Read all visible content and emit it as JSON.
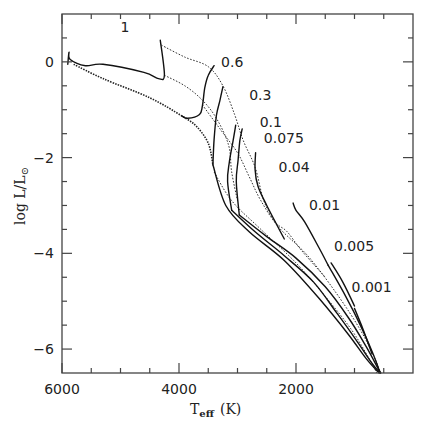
{
  "chart_data": {
    "type": "line",
    "title": "",
    "xlabel": "T_eff (K)",
    "xlabel_main": "T",
    "xlabel_sub": "eff",
    "xlabel_unit": "(K)",
    "ylabel": "log L/L⊙",
    "ylabel_main": "log L/L",
    "ylabel_sub": "⊙",
    "xlim": [
      6000,
      0
    ],
    "ylim": [
      -6.5,
      1.0
    ],
    "x_inverted": true,
    "grid": false,
    "x_major_ticks": [
      6000,
      4000,
      2000
    ],
    "x_minor_ticks": [
      5500,
      5000,
      4500,
      3500,
      3000,
      2500,
      1500,
      1000,
      500
    ],
    "x_tick_labels": [
      "6000",
      "4000",
      "2000"
    ],
    "y_major_ticks": [
      0,
      -2,
      -4,
      -6
    ],
    "y_minor_ticks": [
      0.5,
      -0.5,
      -1,
      -1.5,
      -2.5,
      -3,
      -3.5,
      -4.5,
      -5,
      -5.5
    ],
    "y_tick_labels": [
      "0",
      "−2",
      "−4",
      "−6"
    ],
    "series_note": "Solid lines: evolutionary tracks labelled by mass (M⊙). Dotted lines: isochrones.",
    "tracks": [
      {
        "name": "1",
        "label_pos": [
          5000,
          0.62
        ],
        "points": [
          [
            5900,
            -0.05
          ],
          [
            5880,
            0.2
          ],
          [
            5860,
            0.05
          ],
          [
            5600,
            -0.08
          ],
          [
            5300,
            -0.05
          ],
          [
            4600,
            -0.22
          ],
          [
            4350,
            -0.35
          ],
          [
            4250,
            -0.28
          ],
          [
            4320,
            0.45
          ]
        ]
      },
      {
        "name": "0.6",
        "label_pos": [
          3280,
          -0.1
        ],
        "points": [
          [
            3950,
            -1.13
          ],
          [
            3850,
            -1.18
          ],
          [
            3650,
            -1.1
          ],
          [
            3600,
            -0.92
          ],
          [
            3560,
            -0.55
          ],
          [
            3500,
            -0.28
          ],
          [
            3400,
            -0.08
          ]
        ]
      },
      {
        "name": "0.3",
        "label_pos": [
          2800,
          -0.8
        ],
        "points": [
          [
            3420,
            -2.15
          ],
          [
            3400,
            -1.62
          ],
          [
            3360,
            -1.12
          ],
          [
            3300,
            -0.8
          ],
          [
            3250,
            -0.52
          ]
        ]
      },
      {
        "name": "0.1",
        "label_pos": [
          2620,
          -1.35
        ],
        "points": [
          [
            3100,
            -3.1
          ],
          [
            3170,
            -2.5
          ],
          [
            3140,
            -2.1
          ],
          [
            3080,
            -1.68
          ],
          [
            3030,
            -1.32
          ]
        ]
      },
      {
        "name": "0.075",
        "label_pos": [
          2550,
          -1.7
        ],
        "points": [
          [
            2970,
            -3.2
          ],
          [
            3020,
            -2.5
          ],
          [
            2990,
            -2.05
          ],
          [
            2960,
            -1.65
          ],
          [
            2920,
            -1.4
          ]
        ]
      },
      {
        "name": "0.04",
        "label_pos": [
          2300,
          -2.3
        ],
        "points": [
          [
            2200,
            -3.7
          ],
          [
            2500,
            -3.0
          ],
          [
            2650,
            -2.6
          ],
          [
            2700,
            -2.25
          ],
          [
            2690,
            -1.9
          ]
        ]
      },
      {
        "name": "0.01",
        "label_pos": [
          1780,
          -3.1
        ],
        "points": [
          [
            1450,
            -4.25
          ],
          [
            1600,
            -3.9
          ],
          [
            1850,
            -3.35
          ],
          [
            2000,
            -3.1
          ],
          [
            2050,
            -2.95
          ]
        ]
      },
      {
        "name": "0.005",
        "label_pos": [
          1350,
          -3.95
        ],
        "points": [
          [
            1000,
            -5.1
          ],
          [
            1200,
            -4.6
          ],
          [
            1400,
            -4.2
          ]
        ]
      },
      {
        "name": "0.001",
        "label_pos": [
          1050,
          -4.8
        ],
        "points": [
          [
            700,
            -6.1
          ],
          [
            850,
            -5.6
          ],
          [
            1000,
            -5.15
          ]
        ]
      }
    ],
    "envelope_tracks": [
      {
        "name": "low-mass-envelope-a",
        "points": [
          [
            3420,
            -2.15
          ],
          [
            3200,
            -3.0
          ],
          [
            2800,
            -3.55
          ],
          [
            2200,
            -4.15
          ],
          [
            1600,
            -4.95
          ],
          [
            1100,
            -5.7
          ],
          [
            800,
            -6.2
          ],
          [
            580,
            -6.55
          ]
        ]
      },
      {
        "name": "low-mass-envelope-b",
        "points": [
          [
            3100,
            -3.1
          ],
          [
            2700,
            -3.55
          ],
          [
            2200,
            -4.05
          ],
          [
            1700,
            -4.6
          ],
          [
            1300,
            -5.25
          ],
          [
            950,
            -5.85
          ],
          [
            700,
            -6.3
          ],
          [
            560,
            -6.55
          ]
        ]
      },
      {
        "name": "low-mass-envelope-c",
        "points": [
          [
            2970,
            -3.2
          ],
          [
            2500,
            -3.65
          ],
          [
            2000,
            -4.1
          ],
          [
            1500,
            -4.7
          ],
          [
            1100,
            -5.35
          ],
          [
            800,
            -5.95
          ],
          [
            600,
            -6.4
          ],
          [
            550,
            -6.55
          ]
        ]
      },
      {
        "name": "low-mass-envelope-d",
        "points": [
          [
            1450,
            -4.25
          ],
          [
            1150,
            -4.9
          ],
          [
            900,
            -5.5
          ],
          [
            700,
            -6.05
          ],
          [
            560,
            -6.55
          ]
        ]
      }
    ],
    "isochrones": [
      {
        "name": "iso-1",
        "style": "heavy",
        "points": [
          [
            5800,
            -0.05
          ],
          [
            5300,
            -0.35
          ],
          [
            4500,
            -0.75
          ],
          [
            3950,
            -1.13
          ],
          [
            3700,
            -1.35
          ],
          [
            3500,
            -1.7
          ],
          [
            3420,
            -2.15
          ]
        ]
      },
      {
        "name": "iso-2",
        "style": "light",
        "points": [
          [
            4250,
            -0.28
          ],
          [
            3900,
            -0.5
          ],
          [
            3600,
            -0.8
          ],
          [
            3350,
            -1.2
          ],
          [
            3150,
            -1.75
          ],
          [
            3100,
            -2.3
          ],
          [
            3000,
            -2.9
          ]
        ]
      },
      {
        "name": "iso-3",
        "style": "light",
        "points": [
          [
            4300,
            0.35
          ],
          [
            3900,
            0.1
          ],
          [
            3500,
            -0.1
          ],
          [
            3250,
            -0.5
          ],
          [
            3050,
            -1.1
          ],
          [
            2900,
            -1.65
          ],
          [
            2700,
            -2.2
          ],
          [
            2550,
            -2.9
          ],
          [
            2350,
            -3.35
          ],
          [
            2150,
            -3.55
          ],
          [
            1900,
            -3.95
          ],
          [
            1500,
            -4.5
          ]
        ]
      },
      {
        "name": "iso-4",
        "style": "light",
        "points": [
          [
            3600,
            -0.9
          ],
          [
            3300,
            -1.4
          ],
          [
            3000,
            -1.9
          ],
          [
            2800,
            -2.4
          ],
          [
            2600,
            -2.9
          ],
          [
            2300,
            -3.45
          ],
          [
            1800,
            -4.05
          ],
          [
            1300,
            -4.85
          ],
          [
            900,
            -5.6
          ],
          [
            650,
            -6.2
          ],
          [
            560,
            -6.55
          ]
        ]
      },
      {
        "name": "iso-5",
        "style": "light",
        "points": [
          [
            3400,
            -2.3
          ],
          [
            3100,
            -2.9
          ],
          [
            2600,
            -3.5
          ],
          [
            2000,
            -4.2
          ],
          [
            1500,
            -4.9
          ],
          [
            1050,
            -5.6
          ],
          [
            750,
            -6.2
          ],
          [
            620,
            -6.55
          ]
        ]
      }
    ]
  }
}
